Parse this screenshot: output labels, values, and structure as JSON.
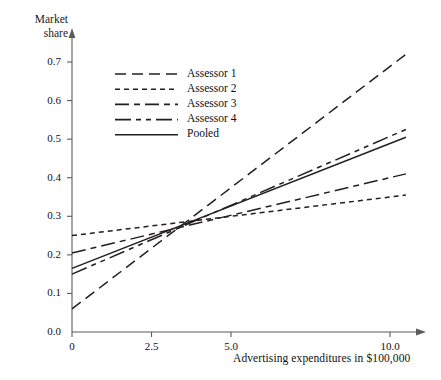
{
  "chart_data": {
    "type": "line",
    "title": "",
    "xlabel": "Advertising expenditures in $100,000",
    "ylabel": "Market share",
    "ylabel_lines": [
      "Market",
      "share"
    ],
    "xlim": [
      0,
      10.5
    ],
    "ylim": [
      0.0,
      0.75
    ],
    "xticks": [
      0,
      2.5,
      5.0,
      10.0
    ],
    "xticklabels": [
      "0",
      "2.5",
      "5.0",
      "10.0"
    ],
    "yticks": [
      0.0,
      0.1,
      0.2,
      0.3,
      0.4,
      0.5,
      0.6,
      0.7
    ],
    "yticklabels": [
      "0.0",
      "0.1",
      "0.2",
      "0.3",
      "0.4",
      "0.5",
      "0.6",
      "0.7"
    ],
    "grid": false,
    "legend_position": "upper-left-inside",
    "x": [
      0,
      10.5
    ],
    "series": [
      {
        "name": "Assessor 1",
        "dash": "long-dash",
        "dasharray": "11,6",
        "color": "#231f20",
        "values": [
          0.06,
          0.72
        ],
        "intercept": 0.06,
        "slope": 0.0629
      },
      {
        "name": "Assessor 2",
        "dash": "short-dash",
        "dasharray": "5,4",
        "color": "#231f20",
        "values": [
          0.25,
          0.355
        ],
        "intercept": 0.25,
        "slope": 0.01
      },
      {
        "name": "Assessor 3",
        "dash": "dash-dot",
        "dasharray": "14,5,6,5",
        "color": "#231f20",
        "values": [
          0.205,
          0.41
        ],
        "intercept": 0.205,
        "slope": 0.0195
      },
      {
        "name": "Assessor 4",
        "dash": "dash-dot-dot",
        "dasharray": "16,5,5,5,5,5",
        "color": "#231f20",
        "values": [
          0.15,
          0.525
        ],
        "intercept": 0.15,
        "slope": 0.0357
      },
      {
        "name": "Pooled",
        "dash": "solid",
        "dasharray": "none",
        "color": "#231f20",
        "values": [
          0.165,
          0.505
        ],
        "intercept": 0.165,
        "slope": 0.0324
      }
    ]
  },
  "legend": {
    "items": [
      {
        "label": "Assessor 1"
      },
      {
        "label": "Assessor 2"
      },
      {
        "label": "Assessor 3"
      },
      {
        "label": "Assessor 4"
      },
      {
        "label": "Pooled"
      }
    ]
  },
  "axes": {
    "y_title_line1": "Market",
    "y_title_line2": "share",
    "x_title": "Advertising expenditures in $100,000"
  }
}
